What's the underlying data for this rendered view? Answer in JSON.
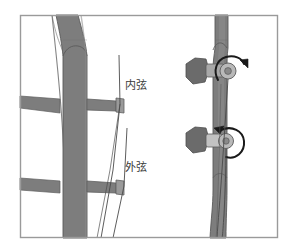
{
  "figure": {
    "name": "erhu-neck-string-diagram",
    "title": "",
    "background_color": "#ffffff",
    "frame": {
      "name": "diagram-border",
      "color": "#9a9a9a",
      "x": 20,
      "y": 15,
      "width": 258,
      "height": 223
    },
    "palette": {
      "wood": "#7d7d7d",
      "wood_dark": "#6b6b6b",
      "wood_light": "#8e8e8e",
      "outline": "#5a5a5a",
      "string": "#4a4a4a",
      "arrow": "#1a1a1a",
      "peg_face": "#b9b9b9",
      "peg_hub": "#8a8a8a",
      "text": "#3a3a3a"
    }
  },
  "labels": {
    "inner_string": "内弦",
    "outer_string": "外弦"
  },
  "left_view": {
    "name": "front-view-of-neck",
    "description_icons": [
      "neck-post-icon",
      "crossbar-upper-icon",
      "crossbar-lower-icon",
      "string-line-icon"
    ]
  },
  "right_view": {
    "name": "side-view-of-pegbox",
    "pegs": [
      {
        "name": "upper-tuning-peg",
        "rotation": "clockwise",
        "arrow_icon": "rotation-arrow-clockwise-icon"
      },
      {
        "name": "lower-tuning-peg",
        "rotation": "counter-clockwise",
        "arrow_icon": "rotation-arrow-counter-clockwise-icon"
      }
    ]
  }
}
